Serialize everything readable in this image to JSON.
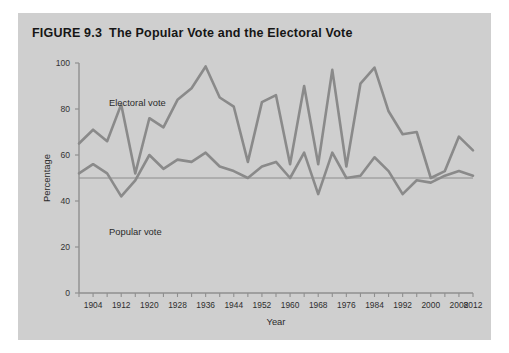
{
  "figure": {
    "number": "FIGURE 9.3",
    "title": "The Popular Vote and the Electoral Vote",
    "panel_bg": "#cfcfcf",
    "page_bg": "#ffffff"
  },
  "chart_data": {
    "type": "line",
    "title": "The Popular Vote and the Electoral Vote",
    "xlabel": "Year",
    "ylabel": "Percentage",
    "ylim": [
      0,
      100
    ],
    "yticks": [
      0,
      20,
      40,
      60,
      80,
      100
    ],
    "ytick_labels": [
      "0",
      "20",
      "40",
      "60",
      "80",
      "100"
    ],
    "xlim": [
      1900,
      2012
    ],
    "xtick_labels": [
      "1904",
      "1912",
      "1920",
      "1928",
      "1936",
      "1944",
      "1952",
      "1960",
      "1968",
      "1976",
      "1984",
      "1992",
      "2000",
      "2008",
      "2012"
    ],
    "xtick_values": [
      1904,
      1912,
      1920,
      1928,
      1936,
      1944,
      1952,
      1960,
      1968,
      1976,
      1984,
      1992,
      2000,
      2008,
      2012
    ],
    "minor_tick_interval": 4,
    "grid": false,
    "legend_position": "inline-annotations",
    "reference_line": {
      "value": 50,
      "label": "50 percent",
      "color": "#8c8c8c"
    },
    "line_color": "#8a8a8a",
    "x": [
      1900,
      1904,
      1908,
      1912,
      1916,
      1920,
      1924,
      1928,
      1932,
      1936,
      1940,
      1944,
      1948,
      1952,
      1956,
      1960,
      1964,
      1968,
      1972,
      1976,
      1980,
      1984,
      1988,
      1992,
      1996,
      2000,
      2004,
      2008,
      2012
    ],
    "series": [
      {
        "name": "Electoral vote",
        "annotation": "Electoral vote",
        "values": [
          65,
          71,
          66,
          82,
          52,
          76,
          72,
          84,
          89,
          98.5,
          85,
          81,
          57,
          83,
          86,
          56,
          90,
          56,
          97,
          55,
          91,
          98,
          79,
          69,
          70,
          50,
          53,
          68,
          62
        ]
      },
      {
        "name": "Popular vote",
        "annotation": "Popular vote",
        "values": [
          52,
          56,
          52,
          42,
          49,
          60,
          54,
          58,
          57,
          61,
          55,
          53,
          50,
          55,
          57,
          50,
          61,
          43,
          61,
          50,
          51,
          59,
          53,
          43,
          49,
          48,
          51,
          53,
          51
        ]
      }
    ]
  }
}
